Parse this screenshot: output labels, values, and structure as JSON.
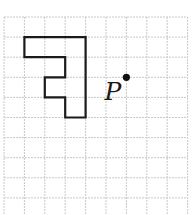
{
  "figure": {
    "grid": {
      "columns": 9,
      "rows_visible": 10,
      "origin_px": [
        4,
        17
      ],
      "cell_w_px": 20.4,
      "cell_h_px": 20.1,
      "line_color": "#c8c8c8"
    },
    "shape": {
      "name": "polygon",
      "vertices_grid": [
        [
          1,
          1
        ],
        [
          4,
          1
        ],
        [
          4,
          5
        ],
        [
          3,
          5
        ],
        [
          3,
          4
        ],
        [
          2,
          4
        ],
        [
          2,
          3
        ],
        [
          3,
          3
        ],
        [
          3,
          2
        ],
        [
          1,
          2
        ]
      ],
      "stroke_color": "#1a1a1a"
    },
    "point": {
      "label": "P",
      "position_grid": [
        6,
        3
      ]
    }
  }
}
